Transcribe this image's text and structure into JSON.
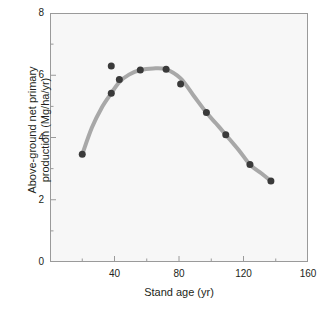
{
  "figure": {
    "background_color": "#ffffff",
    "plot_background_color": "#f7f7f7",
    "frame_color": "#9a9a9a"
  },
  "chart_data": {
    "type": "scatter",
    "title": "",
    "subtitle": "",
    "xlabel": "Stand age (yr)",
    "ylabel_line1": "Above-ground net primary",
    "ylabel_line2": "production (Mg/ha/yr)",
    "ylabel": "Above-ground net primary production (Mg/ha/yr)",
    "xlim": [
      0,
      160
    ],
    "ylim": [
      0,
      8
    ],
    "xticks": [
      0,
      40,
      80,
      120,
      160
    ],
    "xtick_labels": [
      "",
      "40",
      "80",
      "120",
      "160"
    ],
    "xticks_minor": [
      20,
      60,
      100,
      140
    ],
    "yticks": [
      0,
      2,
      4,
      6,
      8
    ],
    "ytick_labels": [
      "0",
      "2",
      "4",
      "6",
      "8"
    ],
    "yticks_minor": [
      1,
      3,
      5,
      7
    ],
    "grid": false,
    "legend": "none",
    "marker_color": "#3a3a3a",
    "marker_size_px": 7,
    "line_color": "#a8a8a8",
    "line_width_px": 4,
    "series": [
      {
        "name": "Above-ground net primary production",
        "marker": "filled-circle",
        "x": [
          20,
          38,
          38,
          43,
          56,
          72,
          81,
          97,
          109,
          124,
          137
        ],
        "y": [
          3.46,
          6.3,
          5.42,
          5.86,
          6.17,
          6.19,
          5.72,
          4.8,
          4.09,
          3.13,
          2.6
        ],
        "points": [
          {
            "x": 20,
            "y": 3.46,
            "on_fitted_curve": true
          },
          {
            "x": 38,
            "y": 6.3,
            "on_fitted_curve": false
          },
          {
            "x": 38,
            "y": 5.42,
            "on_fitted_curve": true
          },
          {
            "x": 43,
            "y": 5.86,
            "on_fitted_curve": true
          },
          {
            "x": 56,
            "y": 6.17,
            "on_fitted_curve": true
          },
          {
            "x": 72,
            "y": 6.19,
            "on_fitted_curve": true
          },
          {
            "x": 81,
            "y": 5.72,
            "on_fitted_curve": true
          },
          {
            "x": 97,
            "y": 4.8,
            "on_fitted_curve": true
          },
          {
            "x": 109,
            "y": 4.09,
            "on_fitted_curve": true
          },
          {
            "x": 124,
            "y": 3.13,
            "on_fitted_curve": true
          },
          {
            "x": 137,
            "y": 2.6,
            "on_fitted_curve": true
          }
        ]
      }
    ],
    "fitted_curve": {
      "name": "fitted trend line",
      "x": [
        20,
        26,
        32,
        38,
        43,
        49,
        56,
        64,
        72,
        81,
        89,
        97,
        103,
        109,
        117,
        124,
        131,
        137
      ],
      "y": [
        3.46,
        4.32,
        4.95,
        5.42,
        5.78,
        6.02,
        6.17,
        6.22,
        6.19,
        5.9,
        5.35,
        4.8,
        4.45,
        4.09,
        3.6,
        3.13,
        2.85,
        2.6
      ]
    }
  }
}
